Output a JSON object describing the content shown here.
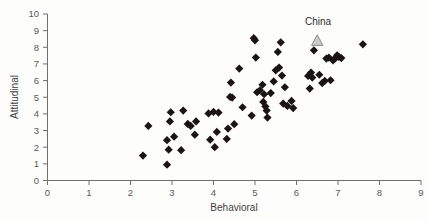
{
  "chart_data": {
    "type": "scatter",
    "title": "",
    "xlabel": "Behavioral",
    "ylabel": "Attitudinal",
    "xlim": [
      0,
      9
    ],
    "ylim": [
      0,
      10
    ],
    "xticks": [
      0,
      1,
      2,
      3,
      4,
      5,
      6,
      7,
      8,
      9
    ],
    "yticks": [
      0,
      1,
      2,
      3,
      4,
      5,
      6,
      7,
      8,
      9,
      10
    ],
    "grid": false,
    "legend": "none",
    "series": [
      {
        "name": "countries",
        "marker": "diamond",
        "color": "#1a1512",
        "points": [
          [
            2.3,
            1.5
          ],
          [
            2.43,
            3.28
          ],
          [
            2.88,
            0.95
          ],
          [
            2.88,
            2.42
          ],
          [
            2.92,
            1.85
          ],
          [
            2.95,
            3.55
          ],
          [
            2.97,
            4.1
          ],
          [
            3.05,
            2.63
          ],
          [
            3.22,
            1.82
          ],
          [
            3.27,
            4.2
          ],
          [
            3.38,
            3.4
          ],
          [
            3.45,
            3.28
          ],
          [
            3.55,
            2.75
          ],
          [
            3.58,
            3.55
          ],
          [
            3.88,
            4.03
          ],
          [
            3.92,
            2.45
          ],
          [
            4.0,
            4.12
          ],
          [
            4.03,
            2.0
          ],
          [
            4.08,
            2.92
          ],
          [
            4.12,
            4.08
          ],
          [
            4.32,
            2.5
          ],
          [
            4.35,
            3.12
          ],
          [
            4.4,
            5.02
          ],
          [
            4.42,
            5.88
          ],
          [
            4.45,
            4.98
          ],
          [
            4.5,
            3.38
          ],
          [
            4.62,
            6.72
          ],
          [
            4.7,
            4.4
          ],
          [
            4.92,
            3.9
          ],
          [
            4.97,
            8.55
          ],
          [
            5.0,
            8.42
          ],
          [
            5.02,
            7.38
          ],
          [
            5.05,
            5.3
          ],
          [
            5.12,
            5.42
          ],
          [
            5.18,
            5.75
          ],
          [
            5.2,
            4.72
          ],
          [
            5.22,
            5.18
          ],
          [
            5.25,
            4.45
          ],
          [
            5.28,
            4.2
          ],
          [
            5.3,
            3.78
          ],
          [
            5.38,
            5.25
          ],
          [
            5.45,
            5.95
          ],
          [
            5.5,
            6.62
          ],
          [
            5.55,
            7.72
          ],
          [
            5.58,
            6.78
          ],
          [
            5.62,
            8.3
          ],
          [
            5.65,
            6.3
          ],
          [
            5.68,
            4.62
          ],
          [
            5.72,
            5.6
          ],
          [
            5.78,
            4.48
          ],
          [
            5.88,
            4.78
          ],
          [
            5.92,
            4.35
          ],
          [
            6.28,
            6.28
          ],
          [
            6.32,
            5.52
          ],
          [
            6.35,
            6.48
          ],
          [
            6.38,
            6.18
          ],
          [
            6.42,
            7.82
          ],
          [
            6.55,
            6.35
          ],
          [
            6.62,
            5.85
          ],
          [
            6.68,
            5.98
          ],
          [
            6.72,
            7.32
          ],
          [
            6.78,
            7.38
          ],
          [
            6.82,
            6.02
          ],
          [
            6.88,
            7.22
          ],
          [
            6.92,
            7.3
          ],
          [
            6.98,
            7.52
          ],
          [
            7.02,
            7.42
          ],
          [
            7.08,
            7.35
          ],
          [
            7.6,
            8.18
          ]
        ]
      },
      {
        "name": "China",
        "marker": "triangle",
        "color": "#c9c9c9",
        "points": [
          [
            6.5,
            8.38
          ]
        ]
      }
    ],
    "annotations": [
      {
        "text": "China",
        "x": 6.52,
        "y": 9.35
      }
    ]
  },
  "axes": {
    "x_title": "Behavioral",
    "y_title": "Attitudinal",
    "x_tick_labels": [
      "0",
      "1",
      "2",
      "3",
      "4",
      "5",
      "6",
      "7",
      "8",
      "9"
    ],
    "y_tick_labels": [
      "0",
      "1",
      "2",
      "3",
      "4",
      "5",
      "6",
      "7",
      "8",
      "9",
      "10"
    ]
  },
  "colors": {
    "marker": "#1a1512",
    "highlight_fill": "#c9c9c9",
    "highlight_stroke": "#8d8d8d",
    "axis": "#6f6f71",
    "text": "#3f3f41",
    "background": "#fdfdfc"
  }
}
